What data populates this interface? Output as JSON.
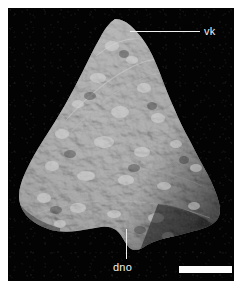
{
  "figure": {
    "type": "specimen-photograph",
    "caption_absent": true,
    "background_color": "#030303",
    "plate_border_color": "#ffffff",
    "surface_tone_light": "#c9c9c9",
    "surface_tone_mid": "#8e8e8e",
    "surface_tone_dark": "#3a3a3a"
  },
  "annotations": [
    {
      "id": "vk",
      "label": "vk",
      "leader": "horizontal",
      "points_to": "apex of specimen",
      "text_color": "#f2f2f2",
      "line_color": "#f0f0f0"
    },
    {
      "id": "dno",
      "label": "dno",
      "leader": "vertical",
      "points_to": "notch at ventral margin of specimen",
      "text_color": "#f2f2f2",
      "line_color": "#f0f0f0"
    }
  ],
  "scale_bar": {
    "name": "scale-bar",
    "color": "#fdfdfd",
    "label": ""
  }
}
